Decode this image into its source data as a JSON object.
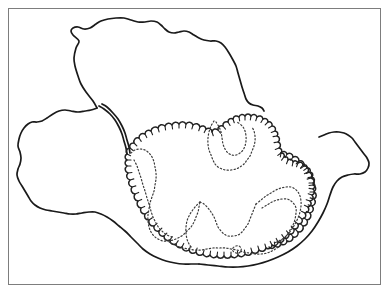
{
  "figure": {
    "width": 387,
    "height": 293,
    "background_color": "#ffffff"
  },
  "colors": {
    "frame_stroke": "#7d7d7d",
    "solid_stroke": "#1a1a1a",
    "scallop_stroke": "#222222",
    "dotted_stroke": "#3a3a3a",
    "background": "#ffffff"
  },
  "frame": {
    "name": "figure-border",
    "x": 8.5,
    "y": 8.5,
    "width": 372,
    "height": 276,
    "stroke_width": 1
  },
  "strokes": {
    "solid_width": 1.7,
    "scallop_width": 1.5,
    "scallop_tick_width": 1.1,
    "dotted_width": 1.2,
    "dotted_dasharray": "1.3 2.2",
    "dotted_dasharray_fine": "1.1 2.0"
  },
  "shapes": {
    "upper_lobe": {
      "name": "upper-lobe-outline",
      "style": "solid",
      "path": "M 97 108 L 93 101 L 86 92 L 81 84 L 78 76 L 75 66 L 74 58 L 76 48 L 79 41 L 73 35 L 71 31 L 73 28 L 78 27 L 84 29 L 90 28 L 96 24 L 101 21 L 108 19 L 116 18 L 124 18 L 131 20 L 138 22 L 145 22 L 151 21 L 157 22 L 161 25 L 165 29 L 169 32 L 174 33 L 179 32 L 184 31 L 189 32 L 194 35 L 199 38 L 204 40 L 210 41 L 216 41 L 221 43 L 225 47 L 229 53 L 233 60 L 236 66 L 238 73 L 240 80 L 242 87 L 244 93 L 246 99 L 249 103 L 253 105 L 258 106 L 262 108 L 264 111"
    },
    "left_lobe": {
      "name": "left-lobe-outline",
      "style": "solid",
      "path": "M 97 108 L 91 110 L 85 111 L 78 112 L 71 111 L 65 110 L 59 111 L 53 114 L 47 118 L 42 121 L 37 122 L 32 122 L 28 124 L 24 128 L 21 133 L 19 139 L 18 146 L 20 152 L 21 158 L 20 164 L 18 169 L 17 175 L 19 181 L 22 186 L 25 191 L 28 196 L 31 201 L 35 205 L 40 208 L 46 210 L 52 211 L 58 212 L 64 213 L 70 214 L 76 214 L 82 213 L 89 212 L 95 212 L 101 214 L 107 217 L 113 221 L 119 226 L 125 231 L 131 237 L 137 243 L 143 249 L 150 254 L 158 258 L 166 261 L 175 263 L 183 264 L 191 264 L 199 264"
    },
    "isthmus_inner": {
      "name": "isthmus-connector-line",
      "style": "solid",
      "path": "M 99 106 L 104 109 L 110 114 L 115 120 L 119 127 L 122 134 L 124 141 L 126 148 L 127 154"
    },
    "isthmus_outer": {
      "name": "isthmus-connector-line-parallel",
      "style": "solid",
      "path": "M 102 104 L 107 107 L 113 113 L 118 119 L 122 126 L 125 133 L 127 140 L 129 147 L 130 153"
    },
    "lower_solid_tail": {
      "name": "lower-tail-outline",
      "style": "solid",
      "path": "M 199 264 L 208 265 L 218 266 L 228 267 L 238 267 L 248 266 L 258 264 L 268 261 L 278 257 L 288 252 L 297 246 L 305 239 L 312 231 L 318 222 L 323 213 L 327 204 L 330 195 L 333 187 L 337 181 L 342 177 L 348 175 L 354 174 L 360 174 L 365 172 L 368 168 L 369 163 L 367 158 L 364 154 L 361 150 L 358 146 L 355 142 L 352 138 L 348 135 L 344 133 L 339 132 L 334 132 L 329 133 L 324 135 L 319 137"
    },
    "scallop_main": {
      "name": "scalloped-lobe-outline",
      "style": "scalloped",
      "path": "M 127 154 L 130 148 L 134 143 L 139 138 L 145 134 L 151 131 L 158 128 L 165 126 L 172 125 L 179 124 L 186 124 L 193 125 L 200 127 L 206 129 L 212 132 L 218 130 L 223 126 L 228 122 L 233 119 L 239 117 L 245 116 L 251 116 L 257 117 L 263 119 L 268 122 L 272 126 L 275 131 L 277 136 L 278 142 L 279 148 L 281 153 L 284 157 L 288 160 L 293 162 L 298 163 L 303 165 L 307 168 L 310 172 L 312 177 L 313 183 L 313 189 L 312 195 L 310 201 L 308 207 L 305 213 L 302 219 L 298 224 L 294 229 L 289 234 L 284 238 L 278 242 L 272 245 L 266 248 L 259 250 L 252 252 L 245 254 L 238 255 L 231 256 L 224 256 L 217 256 L 210 255 L 203 254 L 196 252 L 189 250 L 182 247 L 176 244 L 170 240 L 164 236 L 159 231 L 154 226 L 149 220 L 145 214 L 141 208 L 138 201 L 135 194 L 132 187 L 130 180 L 128 173 L 127 166 L 127 160 Z"
    },
    "scallop_right": {
      "name": "scalloped-right-lobe-outline",
      "style": "scalloped",
      "path": "M 281 153 L 287 154 L 293 157 L 299 161 L 304 166 L 308 172 L 311 178 L 313 185 L 314 192 L 314 199 L 312 206 L 310 213 L 307 220 L 303 226 L 298 232 L 293 237 L 287 241 L 281 244 L 275 246 L 269 247"
    },
    "dotted_1": {
      "name": "dotted-interior-boundary-upper-right",
      "style": "dotted",
      "path": "M 216 122 L 219 127 L 221 132 L 222 138 L 223 144 L 225 149 L 228 153 L 232 155 L 236 155 L 240 153 L 243 150 L 245 146 L 246 141 L 246 136 L 245 131 L 243 127 L 240 124 L 237 122"
    },
    "dotted_2": {
      "name": "dotted-interior-boundary-central",
      "style": "dotted",
      "path": "M 214 121 L 211 126 L 209 132 L 208 138 L 208 144 L 209 150 L 211 155 L 213 160 L 215 164 L 218 167 L 222 169 L 226 170 L 231 170 L 236 169 L 240 167 L 244 164 L 247 160 L 250 156 L 252 151 L 254 146 L 255 141 L 255 136 L 254 131 L 252 127"
    },
    "dotted_3": {
      "name": "dotted-interior-boundary-left-inner",
      "style": "dotted",
      "path": "M 131 153 L 135 150 L 140 149 L 145 150 L 149 153 L 152 157 L 154 162 L 155 167 L 156 173 L 156 179 L 155 185 L 154 191 L 152 197 L 150 203 L 149 209 L 148 215 L 148 221 L 149 227 L 151 232 L 154 236 L 158 239 L 163 241 L 168 241 L 173 240 L 178 238 L 183 235 L 187 231 L 191 227 L 194 222 L 196 217 L 198 212 L 199 207 L 200 202"
    },
    "dotted_4": {
      "name": "dotted-interior-boundary-lower-central",
      "style": "dotted",
      "path": "M 200 202 L 204 204 L 208 208 L 211 212 L 214 217 L 216 222 L 218 227 L 221 231 L 224 234 L 228 236 L 233 236 L 238 235 L 242 232 L 245 228 L 248 224 L 250 219 L 252 214 L 254 209 L 256 204"
    },
    "dotted_5": {
      "name": "dotted-interior-boundary-lower-sweep",
      "style": "dotted",
      "path": "M 166 240 L 171 243 L 177 246 L 183 248 L 189 249 L 195 250 L 201 250 L 207 249 L 213 248 L 219 248 L 225 248 L 231 249 L 237 250 L 243 252 L 249 253 L 255 254 L 261 254 L 267 253 L 272 251 L 277 248 L 281 244"
    },
    "dotted_6": {
      "name": "dotted-interior-boundary-right-band-outer",
      "style": "dotted",
      "path": "M 256 204 L 261 200 L 266 196 L 271 193 L 276 190 L 281 188 L 286 187 L 291 187 L 295 189 L 298 192 L 300 196 L 301 201 L 301 206 L 300 212 L 298 218 L 295 224 L 292 229 L 288 234 L 284 238 L 279 241 L 274 243"
    },
    "dotted_7": {
      "name": "dotted-interior-boundary-right-band-inner",
      "style": "dotted",
      "path": "M 262 208 L 267 205 L 272 202 L 277 200 L 282 199 L 287 199 L 291 201 L 294 204 L 296 208 L 296 213 L 295 219 L 293 225 L 290 230 L 287 235 L 283 239 L 278 242"
    },
    "dotted_8": {
      "name": "dotted-interior-boundary-left-band",
      "style": "dotted",
      "path": "M 134 160 L 137 166 L 139 172 L 141 178 L 143 185 L 145 191 L 147 198 L 149 204 L 151 211 L 153 217 L 156 223 L 159 228 L 163 232 L 167 235 L 172 237"
    },
    "dotted_9": {
      "name": "dotted-interior-boundary-notch",
      "style": "dotted",
      "path": "M 200 202 L 196 206 L 192 211 L 189 216 L 187 221 L 186 227 L 186 233 L 187 239 L 189 244 L 192 248"
    },
    "dotted_10": {
      "name": "dotted-interior-small-loop",
      "style": "dotted",
      "path": "M 233 248 L 236 246 L 239 246 L 241 248 L 241 251 L 239 253 L 236 253 L 233 251 Z"
    }
  },
  "scallop_ticks": {
    "name": "scallop-tick-marks",
    "description": "Short inward strokes spaced along the scalloped margins",
    "main_count": 46,
    "right_count": 16,
    "length": 4
  }
}
